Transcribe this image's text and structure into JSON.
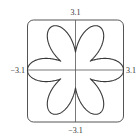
{
  "chart_data": {
    "type": "line",
    "subtype": "polar-curve",
    "title": "",
    "xlabel": "",
    "ylabel": "",
    "curve": {
      "base": 1.1,
      "amplitude": 2.0,
      "k": 3
    },
    "xlim": [
      -3.1,
      3.1
    ],
    "ylim": [
      -3.1,
      3.1
    ],
    "grid": false,
    "axes_through_origin": true,
    "tick_labels": {
      "top": "3.1",
      "bottom": "−3.1",
      "left": "−3.1",
      "right": "3.1"
    },
    "colors": {
      "curve": "#3a3a3a",
      "axes": "#555555",
      "frame": "#555555"
    }
  }
}
